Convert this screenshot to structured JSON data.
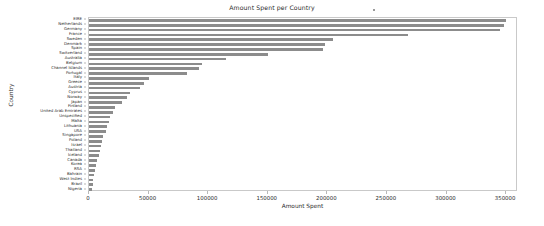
{
  "chart_data": {
    "type": "bar",
    "orientation": "horizontal",
    "title": "Amount Spent per Country",
    "xlabel": "Amount Spent",
    "ylabel": "Country",
    "xlim": [
      0,
      360000
    ],
    "xticks": [
      0,
      50000,
      100000,
      150000,
      200000,
      250000,
      300000,
      350000
    ],
    "xtick_labels": [
      "0",
      "50000",
      "100000",
      "150000",
      "200000",
      "250000",
      "300000",
      "350000"
    ],
    "grid": false,
    "legend": null,
    "bar_color": "#8c8c8c",
    "categories": [
      "EIRE",
      "Netherlands",
      "Germany",
      "France",
      "Sweden",
      "Denmark",
      "Spain",
      "Switzerland",
      "Australia",
      "Belgium",
      "Channel Islands",
      "Portugal",
      "Italy",
      "Greece",
      "Austria",
      "Cyprus",
      "Norway",
      "Japan",
      "Finland",
      "United Arab Emirates",
      "Unspecified",
      "Malta",
      "Lithuania",
      "USA",
      "Singapore",
      "Poland",
      "Israel",
      "Thailand",
      "Iceland",
      "Canada",
      "Korea",
      "RSA",
      "Bahrain",
      "West Indies",
      "Brazil",
      "Nigeria"
    ],
    "values": [
      350000,
      348000,
      345000,
      268000,
      205000,
      198000,
      196000,
      150000,
      115000,
      95000,
      92000,
      82000,
      50000,
      46000,
      43000,
      34000,
      32000,
      28000,
      22000,
      20000,
      18000,
      17000,
      15000,
      14000,
      12000,
      11000,
      10000,
      9000,
      8000,
      7000,
      6000,
      5000,
      4000,
      3500,
      3000,
      2500
    ]
  },
  "figure": {
    "title": "Amount Spent per Country",
    "xlabel": "Amount Spent",
    "ylabel": "Country"
  }
}
